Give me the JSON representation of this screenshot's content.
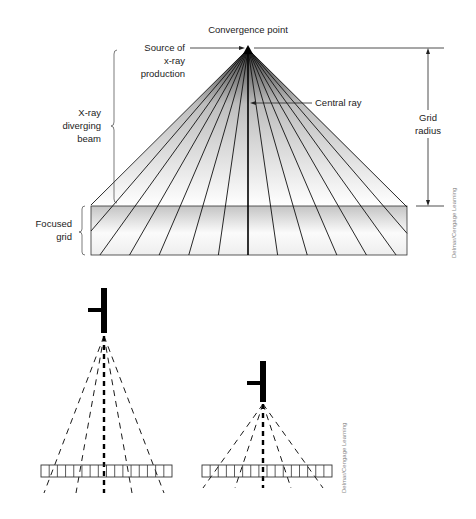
{
  "figure_top": {
    "labels": {
      "convergence_point": "Convergence point",
      "source_line1": "Source of",
      "source_line2": "x-ray",
      "source_line3": "production",
      "central_ray": "Central ray",
      "beam_line1": "X-ray",
      "beam_line2": "diverging",
      "beam_line3": "beam",
      "grid_radius_line1": "Grid",
      "grid_radius_line2": "radius",
      "focused_grid_line1": "Focused",
      "focused_grid_line2": "grid"
    },
    "apex": {
      "x": 248,
      "y": 49
    },
    "grid": {
      "x": 91,
      "y": 206,
      "width": 316,
      "height": 49
    },
    "beam_base_y": 206,
    "beam_base_left": 91,
    "beam_base_right": 407,
    "ray_count": 15,
    "colors": {
      "line": "#111111",
      "grid_fill_dark": "#c8c8c8",
      "grid_fill_light": "#fafafa",
      "beam_fill_top": "#2a2a2a",
      "beam_fill_bottom": "#ffffff"
    },
    "credit": "Delmar/Cengage Learning"
  },
  "figure_bottom": {
    "tubes": [
      {
        "name": "tube-far",
        "bar": {
          "x": 101,
          "y": 288,
          "w": 6,
          "h": 45
        },
        "arm": {
          "x": 88,
          "y": 308,
          "w": 13,
          "h": 4
        },
        "apex": {
          "x": 104,
          "y": 336
        },
        "grid": {
          "x": 41,
          "y": 465,
          "w": 131,
          "h": 12,
          "cells": 16
        },
        "ray_end_dx": [
          -60,
          -28,
          0,
          28,
          60
        ],
        "ray_end_y": 493
      },
      {
        "name": "tube-near",
        "bar": {
          "x": 260,
          "y": 361,
          "w": 6,
          "h": 41
        },
        "arm": {
          "x": 247,
          "y": 381,
          "w": 13,
          "h": 4
        },
        "apex": {
          "x": 263,
          "y": 404
        },
        "grid": {
          "x": 202,
          "y": 465,
          "w": 130,
          "h": 12,
          "cells": 16
        },
        "ray_end_dx": [
          -60,
          -28,
          0,
          28,
          60
        ],
        "ray_end_y": 488
      }
    ],
    "credit": "Delmar/Cengage Learning"
  }
}
